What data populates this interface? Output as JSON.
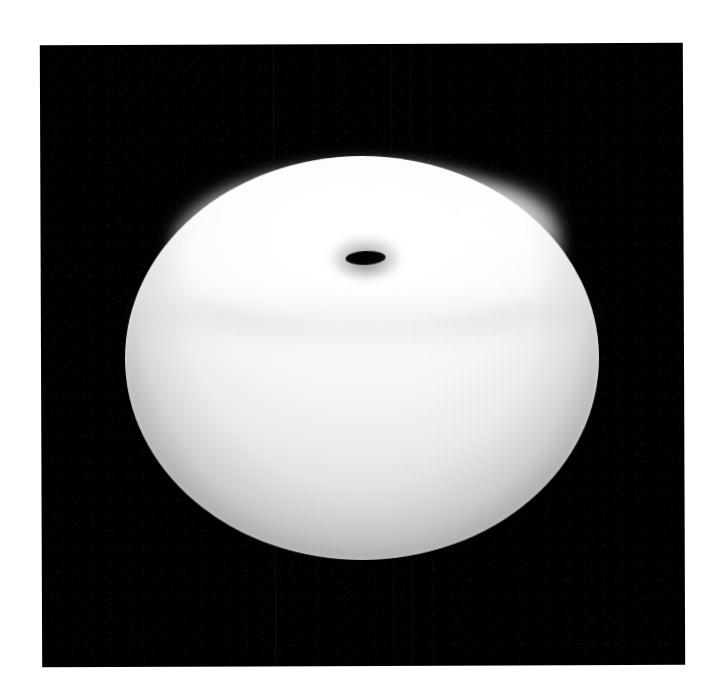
{
  "image": {
    "kind": "photograph",
    "subject": "bright oblate spheroid with dark elliptical aperture",
    "background_color": "#010101",
    "margin_color": "#ffffff",
    "body_color": "#f7f7f7",
    "vent_color": "#000000",
    "caption": "",
    "alt_text": "A brightly lit, overexposed oblate spheroid centred on a black field, with a small dark elliptical opening near the top."
  },
  "panel": {
    "x": 41,
    "y": 44,
    "width": 643,
    "height": 622,
    "rotation_deg": -0.22,
    "label": ""
  },
  "spheroid": {
    "center_x": 321,
    "center_y": 314,
    "radius_x": 237,
    "radius_y": 202,
    "label": ""
  },
  "vent": {
    "center_x": 325,
    "center_y": 214,
    "width": 40,
    "height": 14,
    "rotation_deg": -2.2,
    "label": ""
  },
  "artifacts": {
    "seam_count": 3,
    "seam_label": ""
  },
  "annotations": {
    "title": "",
    "subtitle": "",
    "scale_bar": "",
    "credit": ""
  }
}
